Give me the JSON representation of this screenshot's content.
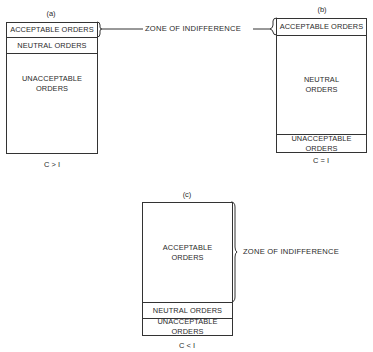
{
  "diagrams": {
    "a": {
      "label": "(a)",
      "rows": [
        "ACCEPTABLE ORDERS",
        "NEUTRAL ORDERS",
        "UNACCEPTABLE\nORDERS"
      ],
      "acceptable": "ACCEPTABLE ORDERS",
      "neutral": "NEUTRAL ORDERS",
      "unacceptable": "UNACCEPTABLE ORDERS",
      "condition": "C > I"
    },
    "b": {
      "label": "(b)",
      "acceptable": "ACCEPTABLE ORDERS",
      "neutral": "NEUTRAL ORDERS",
      "unacceptable": "UNACCEPTABLE ORDERS",
      "condition": "C = I"
    },
    "c": {
      "label": "(c)",
      "acceptable": "ACCEPTABLE ORDERS",
      "neutral": "NEUTRAL ORDERS",
      "unacceptable": "UNACCEPTABLE ORDERS",
      "condition": "C < I"
    }
  },
  "annotations": {
    "zone_top": "ZONE OF INDIFFERENCE",
    "zone_c": "ZONE OF INDIFFERENCE"
  }
}
